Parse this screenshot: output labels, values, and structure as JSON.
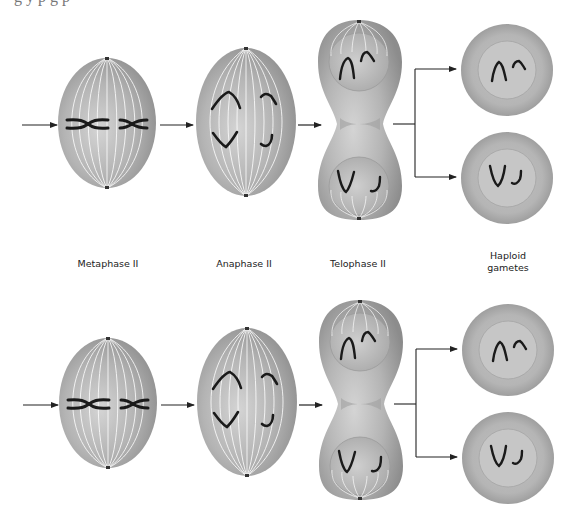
{
  "figure": {
    "caption_fragment": "g  y p                       g  p",
    "stage_labels": {
      "metaphase": "Metaphase II",
      "anaphase": "Anaphase II",
      "telophase": "Telophase II",
      "gametes_line1": "Haploid",
      "gametes_line2": "gametes"
    },
    "rows": [
      {
        "name": "top-row",
        "offset_y": 0
      },
      {
        "name": "bottom-row",
        "offset_y": 280
      }
    ],
    "colors": {
      "cell_fill": "#b8b8b8",
      "cell_dark": "#8e8e8e",
      "cell_light": "#d8d8d8",
      "spindle": "#ffffff",
      "chromosome": "#1a1a1a",
      "arrow": "#222222"
    }
  }
}
